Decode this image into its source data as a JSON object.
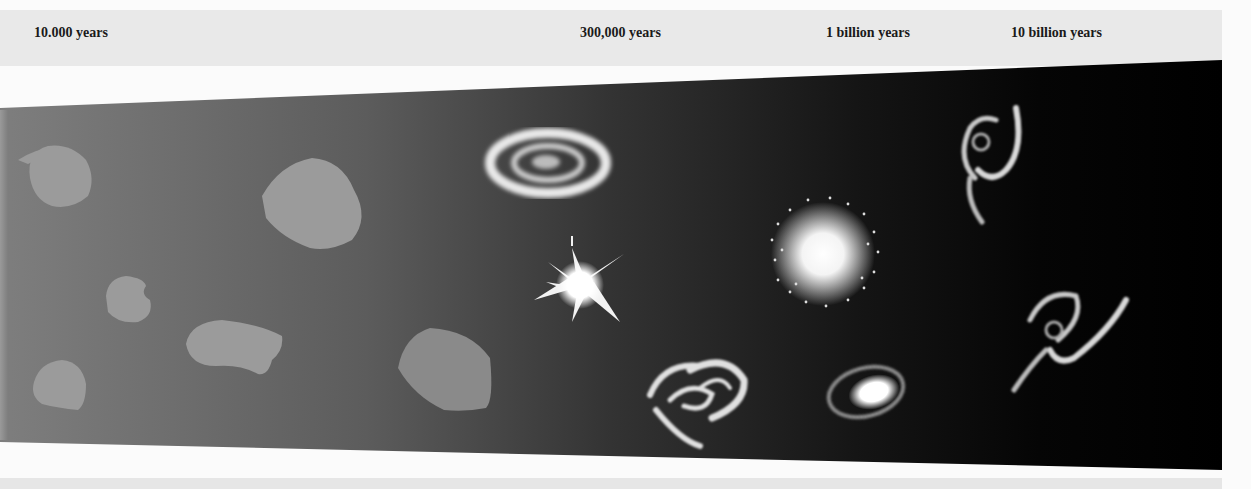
{
  "timeline": {
    "labels": [
      {
        "text": "10.000 years",
        "x": 34
      },
      {
        "text": "300,000 years",
        "x": 580
      },
      {
        "text": "1 billion years",
        "x": 826
      },
      {
        "text": "10 billion years",
        "x": 1011
      }
    ]
  },
  "band": {
    "gradient_start": "#7e7e7e",
    "gradient_mid": "#333333",
    "gradient_end": "#000000",
    "gas_cloud_color": "#9a9a9a"
  },
  "objects": [
    {
      "type": "gas-cloud",
      "epoch": "10.000 years"
    },
    {
      "type": "gas-cloud",
      "epoch": "10.000 years"
    },
    {
      "type": "gas-cloud",
      "epoch": "10.000 years"
    },
    {
      "type": "gas-cloud",
      "epoch": "10.000 years"
    },
    {
      "type": "gas-cloud",
      "epoch": "10.000 years"
    },
    {
      "type": "gas-cloud",
      "epoch": "10.000 years"
    },
    {
      "type": "spiral-protogalaxy",
      "epoch": "300,000 years"
    },
    {
      "type": "starburst",
      "epoch": "300,000 years"
    },
    {
      "type": "merging-galaxies",
      "epoch": "300,000 years"
    },
    {
      "type": "elliptical-galaxy",
      "epoch": "1 billion years"
    },
    {
      "type": "small-spiral-galaxy",
      "epoch": "1 billion years"
    },
    {
      "type": "spiral-galaxy",
      "epoch": "10 billion years"
    },
    {
      "type": "spiral-galaxy",
      "epoch": "10 billion years"
    }
  ]
}
